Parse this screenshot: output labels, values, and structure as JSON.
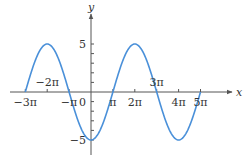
{
  "chart_data": {
    "type": "line",
    "title": "",
    "xlabel": "x",
    "ylabel": "y",
    "function": "y = -5 cos(x/2)",
    "xlim_pi": [
      -3,
      5
    ],
    "ylim": [
      -5,
      5
    ],
    "grid": false,
    "legend": null,
    "line_color": "#4a90d9",
    "x_ticks": [
      {
        "value_pi": -3,
        "label": "−3π",
        "position": "below"
      },
      {
        "value_pi": -2,
        "label": "−2π",
        "position": "above"
      },
      {
        "value_pi": -1,
        "label": "−π",
        "position": "below"
      },
      {
        "value_pi": 1,
        "label": "π",
        "position": "below"
      },
      {
        "value_pi": 2,
        "label": "2π",
        "position": "below"
      },
      {
        "value_pi": 3,
        "label": "3π",
        "position": "above"
      },
      {
        "value_pi": 4,
        "label": "4π",
        "position": "below"
      },
      {
        "value_pi": 5,
        "label": "5π",
        "position": "below"
      }
    ],
    "y_ticks": [
      {
        "value": 5,
        "label": "5"
      },
      {
        "value": 0,
        "label": "0"
      },
      {
        "value": -5,
        "label": "−5"
      }
    ],
    "key_points": [
      {
        "x_pi": -3,
        "y": 0
      },
      {
        "x_pi": -2,
        "y": 5
      },
      {
        "x_pi": -1,
        "y": 0
      },
      {
        "x_pi": 0,
        "y": -5
      },
      {
        "x_pi": 1,
        "y": 0
      },
      {
        "x_pi": 2,
        "y": 5
      },
      {
        "x_pi": 3,
        "y": 0
      },
      {
        "x_pi": 4,
        "y": -5
      },
      {
        "x_pi": 5,
        "y": 0
      }
    ]
  },
  "layout": {
    "origin_px": [
      91,
      92
    ],
    "px_per_pi": 21.9,
    "px_per_unit_y": 9.6,
    "x_axis_start": 10,
    "x_axis_end": 232,
    "y_axis_top": 14,
    "y_axis_bottom": 155
  }
}
